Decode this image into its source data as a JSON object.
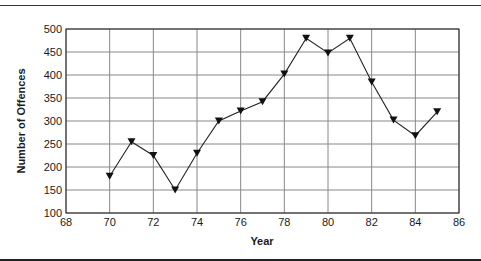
{
  "chart_data": {
    "type": "line",
    "title": "",
    "xlabel": "Year",
    "ylabel": "Number of Offences",
    "xlim": [
      68,
      86
    ],
    "ylim": [
      100,
      500
    ],
    "x_ticks": [
      68,
      70,
      72,
      74,
      76,
      78,
      80,
      82,
      84,
      86
    ],
    "y_ticks": [
      100,
      150,
      200,
      250,
      300,
      350,
      400,
      450,
      500
    ],
    "grid": true,
    "legend": null,
    "marker": "down-triangle",
    "series": [
      {
        "name": "Number of Offences",
        "x": [
          70,
          71,
          72,
          73,
          74,
          75,
          76,
          77,
          78,
          79,
          80,
          81,
          82,
          83,
          84,
          85
        ],
        "values": [
          180,
          255,
          225,
          150,
          230,
          300,
          322,
          342,
          402,
          480,
          448,
          480,
          385,
          302,
          268,
          320
        ]
      }
    ]
  }
}
